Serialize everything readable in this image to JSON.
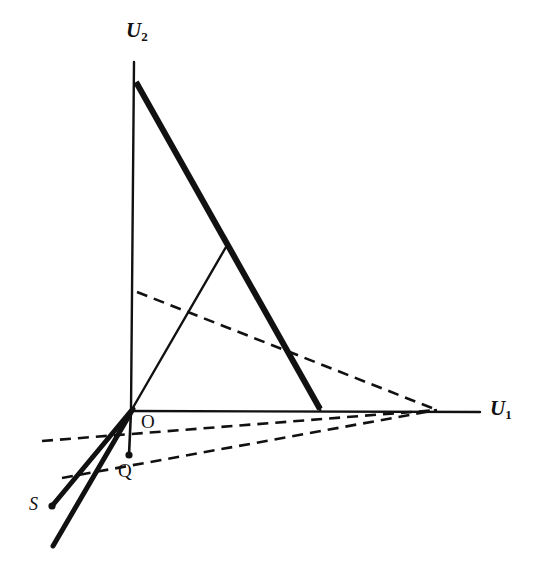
{
  "figure": {
    "type": "geometric-diagram",
    "background_color": "#ffffff",
    "stroke_color": "#111111",
    "labels": {
      "u2_axis": "U",
      "u2_axis_sub": "2",
      "u1_axis": "U",
      "u1_axis_sub": "1",
      "origin": "O",
      "point_q": "Q",
      "point_s": "S"
    },
    "geometry": {
      "origin": [
        131,
        411
      ],
      "u2_axis": {
        "from": [
          134,
          62
        ],
        "to": [
          131,
          411
        ],
        "width": 2.4,
        "style": "solid"
      },
      "u1_axis": {
        "from": [
          131,
          411
        ],
        "to": [
          480,
          412
        ],
        "width": 2.4,
        "style": "solid"
      },
      "frontier_thick": {
        "from": [
          136,
          82
        ],
        "to": [
          320,
          409
        ],
        "width": 6.0,
        "style": "solid"
      },
      "ray_from_origin": {
        "from": [
          131,
          411
        ],
        "to": [
          226,
          247
        ],
        "width": 2.4,
        "style": "solid"
      },
      "frontier_drop": {
        "from": [
          320,
          409
        ],
        "to": [
          320,
          412
        ],
        "width": 2.4,
        "style": "solid"
      },
      "oq_segment": {
        "from": [
          131,
          411
        ],
        "to": [
          129,
          455
        ],
        "width": 2.6,
        "style": "solid"
      },
      "thick_ray_to_s": {
        "from": [
          131,
          411
        ],
        "to": [
          52,
          506
        ],
        "width": 5.0,
        "style": "solid"
      },
      "thick_ray_lower": {
        "from": [
          133,
          409
        ],
        "to": [
          53,
          546
        ],
        "width": 5.0,
        "style": "solid"
      },
      "dashed_upper": {
        "from": [
          137,
          292
        ],
        "to": [
          437,
          410
        ],
        "width": 2.6,
        "style": "dashed"
      },
      "dashed_through_origin": {
        "from": [
          42,
          441
        ],
        "to": [
          437,
          410
        ],
        "width": 2.6,
        "style": "dashed"
      },
      "dashed_through_q": {
        "from": [
          62,
          478
        ],
        "to": [
          437,
          410
        ],
        "width": 2.6,
        "style": "dashed"
      },
      "dash_pattern": "11 7"
    },
    "markers": {
      "point_q": {
        "cx": 129,
        "cy": 455,
        "r": 3.6
      },
      "point_s": {
        "cx": 52,
        "cy": 506,
        "r": 3.6
      }
    }
  }
}
